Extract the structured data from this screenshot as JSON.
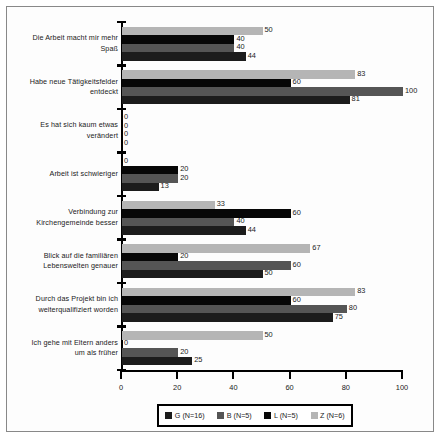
{
  "chart_data": {
    "type": "bar",
    "orientation": "horizontal",
    "title": "",
    "xlabel": "",
    "ylabel": "",
    "xlim": [
      0,
      100
    ],
    "xticks": [
      0,
      20,
      40,
      60,
      80,
      100
    ],
    "grid": false,
    "legend_position": "bottom",
    "categories": [
      "Die Arbeit macht mir mehr Spaß",
      "Habe neue Tätigkeitsfelder entdeckt",
      "Es hat sich kaum etwas verändert",
      "Arbeit ist schwieriger",
      "Verbindung zur Kirchengemeinde besser",
      "Blick auf die familiären Lebenswelten genauer",
      "Durch das Projekt bin ich weiterqualifiziert worden",
      "Ich gehe mit Eltern anders um als früher"
    ],
    "category_lines": [
      [
        "Die Arbeit macht mir mehr",
        "Spaß"
      ],
      [
        "Habe neue Tätigkeitsfelder",
        "entdeckt"
      ],
      [
        "Es hat sich kaum etwas",
        "verändert"
      ],
      [
        "Arbeit ist schwieriger"
      ],
      [
        "Verbindung zur",
        "Kirchengemeinde besser"
      ],
      [
        "Blick auf die familiären",
        "Lebenswelten genauer"
      ],
      [
        "Durch das Projekt bin ich",
        "weiterqualifiziert worden"
      ],
      [
        "Ich gehe mit Eltern anders",
        "um als früher"
      ]
    ],
    "series": [
      {
        "name": "Z (N=6)",
        "key": "Z",
        "color": "#b5b5b5",
        "values": [
          50,
          83,
          0,
          0,
          33,
          67,
          83,
          50
        ]
      },
      {
        "name": "L (N=5)",
        "key": "L",
        "color": "#070707",
        "values": [
          40,
          60,
          0,
          20,
          60,
          20,
          60,
          0
        ]
      },
      {
        "name": "B (N=5)",
        "key": "B",
        "color": "#555555",
        "values": [
          40,
          100,
          0,
          20,
          40,
          60,
          80,
          20
        ]
      },
      {
        "name": "G (N=16)",
        "key": "G",
        "color": "#1c1c1c",
        "values": [
          44,
          81,
          0,
          13,
          44,
          50,
          75,
          25
        ]
      }
    ]
  },
  "legend": {
    "items": [
      {
        "label": "G (N=16)",
        "color": "#1c1c1c",
        "swatch": "legend-swatch-g"
      },
      {
        "label": "B (N=5)",
        "color": "#555555",
        "swatch": "legend-swatch-b"
      },
      {
        "label": "L (N=5)",
        "color": "#070707",
        "swatch": "legend-swatch-l"
      },
      {
        "label": "Z (N=6)",
        "color": "#b5b5b5",
        "swatch": "legend-swatch-z"
      }
    ]
  }
}
